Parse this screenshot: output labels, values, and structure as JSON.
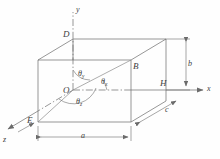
{
  "figure": {
    "type": "3d-rectangular-box-direction-angles",
    "stroke_color": "#6b6b6b",
    "text_color": "#3f3f3f",
    "background": "#fefefe"
  },
  "axes": [
    {
      "name": "y-axis",
      "label": "y",
      "direction": "up"
    },
    {
      "name": "x-axis",
      "label": "x",
      "direction": "right"
    },
    {
      "name": "z-axis",
      "label": "z",
      "direction": "down-left"
    }
  ],
  "vertices": [
    {
      "name": "origin",
      "label": "O"
    },
    {
      "name": "top-back-left",
      "label": "D"
    },
    {
      "name": "front-top-right",
      "label": "B"
    },
    {
      "name": "front-bottom-right-axis",
      "label": "H"
    },
    {
      "name": "bottom-front-left",
      "label": "E"
    }
  ],
  "angles": [
    {
      "name": "theta-y",
      "symbol": "θ",
      "subscript": "y"
    },
    {
      "name": "theta-x",
      "symbol": "θ",
      "subscript": "x"
    },
    {
      "name": "theta-z",
      "symbol": "θ",
      "subscript": "z"
    }
  ],
  "dimensions": [
    {
      "name": "length-a",
      "label": "a"
    },
    {
      "name": "height-b",
      "label": "b"
    },
    {
      "name": "depth-c",
      "label": "c"
    }
  ]
}
